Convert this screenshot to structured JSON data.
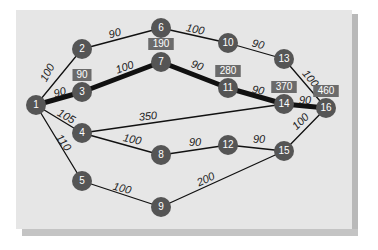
{
  "diagram": {
    "type": "network",
    "colors": {
      "panel": "#e6e6e6",
      "node_fill": "#555555",
      "node_text": "#ffffff",
      "edge": "#111111",
      "badge_fill": "#6b6b6b",
      "badge_text": "#ffffff"
    },
    "nodes": [
      {
        "id": "1",
        "label": "1",
        "x": 36,
        "y": 105
      },
      {
        "id": "2",
        "label": "2",
        "x": 82,
        "y": 49
      },
      {
        "id": "3",
        "label": "3",
        "x": 82,
        "y": 92
      },
      {
        "id": "4",
        "label": "4",
        "x": 82,
        "y": 133
      },
      {
        "id": "5",
        "label": "5",
        "x": 82,
        "y": 181
      },
      {
        "id": "6",
        "label": "6",
        "x": 161,
        "y": 28
      },
      {
        "id": "7",
        "label": "7",
        "x": 161,
        "y": 62
      },
      {
        "id": "8",
        "label": "8",
        "x": 161,
        "y": 155
      },
      {
        "id": "9",
        "label": "9",
        "x": 161,
        "y": 207
      },
      {
        "id": "10",
        "label": "10",
        "x": 228,
        "y": 43
      },
      {
        "id": "11",
        "label": "11",
        "x": 228,
        "y": 88
      },
      {
        "id": "12",
        "label": "12",
        "x": 228,
        "y": 145
      },
      {
        "id": "13",
        "label": "13",
        "x": 284,
        "y": 59
      },
      {
        "id": "14",
        "label": "14",
        "x": 284,
        "y": 104
      },
      {
        "id": "15",
        "label": "15",
        "x": 284,
        "y": 151
      },
      {
        "id": "16",
        "label": "16",
        "x": 326,
        "y": 108
      }
    ],
    "edges": [
      {
        "from": "1",
        "to": "2",
        "weight": "100",
        "critical": false,
        "lx": 48,
        "ly": 73,
        "rot": -62
      },
      {
        "from": "1",
        "to": "3",
        "weight": "90",
        "critical": true,
        "lx": 60,
        "ly": 93,
        "rot": -15
      },
      {
        "from": "1",
        "to": "4",
        "weight": "105",
        "critical": false,
        "lx": 66,
        "ly": 117,
        "rot": 30
      },
      {
        "from": "1",
        "to": "5",
        "weight": "110",
        "critical": false,
        "lx": 63,
        "ly": 143,
        "rot": 55
      },
      {
        "from": "2",
        "to": "6",
        "weight": "90",
        "critical": false,
        "lx": 115,
        "ly": 34,
        "rot": -15
      },
      {
        "from": "3",
        "to": "7",
        "weight": "100",
        "critical": true,
        "lx": 125,
        "ly": 68,
        "rot": -20
      },
      {
        "from": "4",
        "to": "14",
        "weight": "350",
        "critical": false,
        "lx": 148,
        "ly": 117,
        "rot": -6
      },
      {
        "from": "4",
        "to": "8",
        "weight": "100",
        "critical": false,
        "lx": 132,
        "ly": 140,
        "rot": 12
      },
      {
        "from": "5",
        "to": "9",
        "weight": "100",
        "critical": false,
        "lx": 122,
        "ly": 189,
        "rot": 15
      },
      {
        "from": "6",
        "to": "10",
        "weight": "100",
        "critical": false,
        "lx": 195,
        "ly": 30,
        "rot": 12
      },
      {
        "from": "7",
        "to": "11",
        "weight": "90",
        "critical": true,
        "lx": 197,
        "ly": 66,
        "rot": 20
      },
      {
        "from": "8",
        "to": "12",
        "weight": "90",
        "critical": false,
        "lx": 195,
        "ly": 143,
        "rot": 0
      },
      {
        "from": "9",
        "to": "15",
        "weight": "200",
        "critical": false,
        "lx": 206,
        "ly": 180,
        "rot": -25
      },
      {
        "from": "10",
        "to": "13",
        "weight": "90",
        "critical": false,
        "lx": 258,
        "ly": 45,
        "rot": 15
      },
      {
        "from": "11",
        "to": "14",
        "weight": "90",
        "critical": true,
        "lx": 258,
        "ly": 91,
        "rot": 10
      },
      {
        "from": "12",
        "to": "15",
        "weight": "90",
        "critical": false,
        "lx": 259,
        "ly": 140,
        "rot": 0
      },
      {
        "from": "13",
        "to": "16",
        "weight": "100",
        "critical": false,
        "lx": 310,
        "ly": 79,
        "rot": 50
      },
      {
        "from": "14",
        "to": "16",
        "weight": "90",
        "critical": true,
        "lx": 305,
        "ly": 101,
        "rot": 0
      },
      {
        "from": "15",
        "to": "16",
        "weight": "100",
        "critical": false,
        "lx": 301,
        "ly": 122,
        "rot": -45
      }
    ],
    "badges": [
      {
        "node": "3",
        "value": "90",
        "x": 82,
        "y": 75
      },
      {
        "node": "7",
        "value": "190",
        "x": 161,
        "y": 44
      },
      {
        "node": "11",
        "value": "280",
        "x": 228,
        "y": 71
      },
      {
        "node": "14",
        "value": "370",
        "x": 284,
        "y": 87
      },
      {
        "node": "16",
        "value": "460",
        "x": 326,
        "y": 91
      }
    ],
    "critical_path": [
      "1",
      "3",
      "7",
      "11",
      "14",
      "16"
    ]
  }
}
